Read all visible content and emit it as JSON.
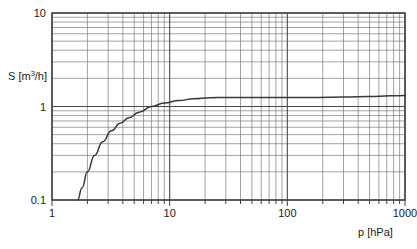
{
  "figure": {
    "title": "",
    "background": "#ffffff",
    "frame_color": "#4d4d4d",
    "grid_major_color": "#555555",
    "grid_minor_color": "#777777",
    "curve_color": "#3a3a3a"
  },
  "axes": {
    "x": {
      "label_prefix": "p",
      "label_unit": "[hPa]",
      "label_full": "p [hPa]",
      "scale": "log",
      "min": 1,
      "max": 1000,
      "tick_labels": [
        "1",
        "10",
        "100",
        "1000"
      ],
      "tick_values": [
        1,
        10,
        100,
        1000
      ]
    },
    "y": {
      "label_prefix": "S",
      "label_unit_open": "[m",
      "label_unit_sup": "3",
      "label_unit_close": "/h]",
      "label_full": "S [m3/h]",
      "scale": "log",
      "min": 0.1,
      "max": 10,
      "tick_labels": [
        "0.1",
        "1",
        "10"
      ],
      "tick_values": [
        0.1,
        1,
        10
      ]
    }
  },
  "chart_data": {
    "type": "line",
    "title": "",
    "xlabel": "p [hPa]",
    "ylabel": "S [m3/h]",
    "xscale": "log",
    "yscale": "log",
    "xlim": [
      1,
      1000
    ],
    "ylim": [
      0.1,
      10
    ],
    "grid": true,
    "legend": null,
    "series": [
      {
        "name": "pumping speed",
        "x": [
          1.65,
          1.8,
          2.0,
          2.3,
          2.7,
          3.2,
          3.8,
          4.5,
          5.5,
          7.0,
          9.0,
          12.0,
          16.0,
          22.0,
          30.0,
          45.0,
          70.0,
          110.0,
          180.0,
          300.0,
          500.0,
          750.0,
          1000.0
        ],
        "y": [
          0.1,
          0.135,
          0.2,
          0.3,
          0.42,
          0.55,
          0.66,
          0.76,
          0.87,
          1.0,
          1.09,
          1.16,
          1.21,
          1.24,
          1.25,
          1.25,
          1.25,
          1.25,
          1.25,
          1.26,
          1.28,
          1.3,
          1.31
        ]
      }
    ]
  }
}
